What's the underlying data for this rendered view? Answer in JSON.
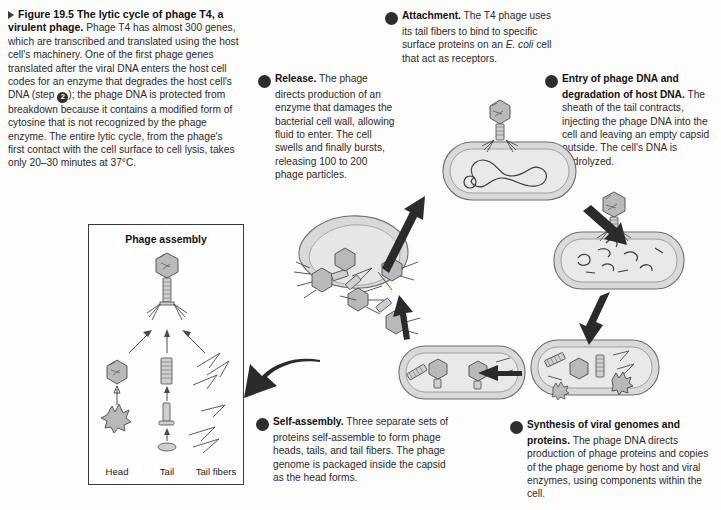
{
  "figure": {
    "number_label": "Figure 19.5",
    "title": "The lytic cycle of phage T4, a virulent phage.",
    "caption_part1": " Phage T4 has almost 300 genes, which are transcribed and translated using the host cell's machinery. One of the first phage genes translated after the viral DNA enters the host cell codes for an enzyme that degrades the host cell's DNA (step ",
    "caption_inline_step": "2",
    "caption_part2": "); the phage DNA is protected from breakdown because it contains a modified form of cytosine that is not recognized by the phage enzyme. The entire lytic cycle, from the phage's first contact with the cell surface to cell lysis, takes only 20–30 minutes at 37°C."
  },
  "steps": [
    {
      "number": "1",
      "title": "Attachment.",
      "text_before_italic": " The T4 phage uses its tail fibers to bind to specific surface proteins on an ",
      "italic_text": "E. coli",
      "text_after_italic": " cell that act as receptors."
    },
    {
      "number": "2",
      "title": "Entry of phage DNA and degradation of host DNA.",
      "text": " The sheath of the tail contracts, injecting the phage DNA into the cell and leaving an empty capsid outside. The cell's DNA is hydrolyzed."
    },
    {
      "number": "3",
      "title": "Synthesis of viral genomes and proteins.",
      "text": " The phage DNA directs production of phage proteins and copies of the phage genome by host and viral enzymes, using components within the cell."
    },
    {
      "number": "4",
      "title": "Self-assembly.",
      "text": " Three separate sets of proteins self-assemble to form phage heads, tails, and tail fibers. The phage genome is packaged inside the capsid as the head forms."
    },
    {
      "number": "5",
      "title": "Release.",
      "text": " The phage directs production of an enzyme that damages the bacterial cell wall, allowing fluid to enter. The cell swells and finally bursts, releasing 100 to 200 phage particles."
    }
  ],
  "assembly_box": {
    "title": "Phage assembly",
    "labels": [
      "Head",
      "Tail",
      "Tail fibers"
    ]
  },
  "colors": {
    "text": "#2b2b2b",
    "heading": "#111111",
    "badge_bg": "#2e2e2e",
    "badge_fg": "#ffffff",
    "cell_fill": "#d9d9d9",
    "cell_stroke": "#6d6d6d",
    "arrow": "#2b2b2b",
    "box_border": "#3a3a3a",
    "background": "#fdfdfc"
  }
}
